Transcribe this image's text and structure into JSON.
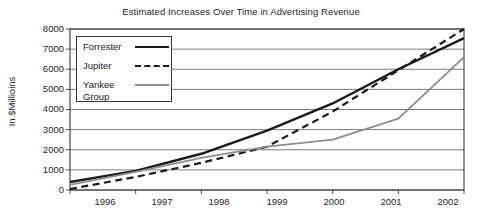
{
  "chart_data": {
    "type": "line",
    "title": "Estimated Increases Over Time in Advertising Revenue",
    "xlabel": "",
    "ylabel": "In $Millioins",
    "categories": [
      "1996",
      "1997",
      "1998",
      "1999",
      "2000",
      "2001",
      "2002"
    ],
    "x": [
      1996,
      1997,
      1998,
      1999,
      2000,
      2001,
      2002
    ],
    "ylim": [
      0,
      8000
    ],
    "xlim": [
      1996,
      2002
    ],
    "yticks": [
      "8000",
      "7000",
      "6000",
      "5000",
      "4000",
      "3000",
      "2000",
      "1000",
      "0"
    ],
    "ytick_values": [
      8000,
      7000,
      6000,
      5000,
      4000,
      3000,
      2000,
      1000,
      0
    ],
    "grid": "horizontal",
    "legend_position": "upper-left-inside",
    "series": [
      {
        "name": "Forrester",
        "style": "solid",
        "color": "#1a1a1a",
        "width": 2.4,
        "values": [
          400,
          950,
          1800,
          2950,
          4300,
          6000,
          7550
        ]
      },
      {
        "name": "Jupiter",
        "style": "dashed",
        "color": "#1a1a1a",
        "width": 2.2,
        "values": [
          50,
          650,
          1350,
          2150,
          3900,
          5950,
          8000
        ]
      },
      {
        "name": "Yankee Group",
        "style": "solid",
        "color": "#8d8d8d",
        "width": 1.8,
        "values": [
          250,
          900,
          1600,
          2150,
          2500,
          3550,
          6600
        ]
      }
    ]
  },
  "legend": {
    "entries": [
      {
        "label": "Forrester",
        "label2": ""
      },
      {
        "label": "Jupiter",
        "label2": ""
      },
      {
        "label": "Yankee",
        "label2": "Group"
      }
    ]
  },
  "colors": {
    "axis": "#3a3a3a",
    "grid": "#6b6b6b",
    "forrester": "#1a1a1a",
    "jupiter": "#1a1a1a",
    "yankee": "#8d8d8d",
    "background": "#ffffff",
    "text": "#262626"
  }
}
